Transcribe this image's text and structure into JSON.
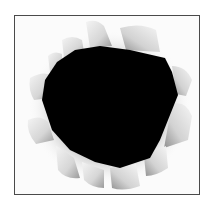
{
  "image": {
    "subject": "torn-paper-hole",
    "colors": {
      "background": "#ffffff",
      "frame_border": "#4a4a4a",
      "paper": "#fbfbfb",
      "curl_light": "#e6e6e6",
      "curl_shadow": "#9a9a9a",
      "hole": "#000000"
    }
  }
}
